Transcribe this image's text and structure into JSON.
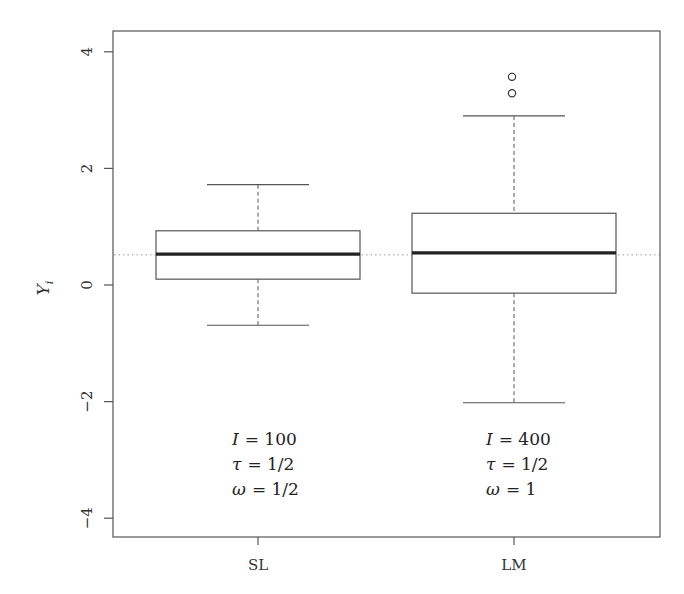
{
  "chart_data": {
    "type": "boxplot",
    "title": "",
    "xlabel": "",
    "ylabel": "Y_i",
    "ylabel_display": {
      "main": "Y",
      "sub": "i"
    },
    "ylim": [
      -4.3,
      4.6
    ],
    "yticks": [
      -4,
      -2,
      0,
      2,
      4
    ],
    "ytick_labels": [
      "−4",
      "−2",
      "0",
      "2",
      "4"
    ],
    "categories": [
      "SL",
      "LM"
    ],
    "reference_line": {
      "y": 0.5,
      "style": "dotted"
    },
    "grid": false,
    "legend": null,
    "boxes": [
      {
        "name": "SL",
        "whisker_low": -0.69,
        "q1": 0.1,
        "median": 0.53,
        "q3": 0.93,
        "whisker_high": 1.72,
        "outliers": [],
        "annotation": [
          {
            "sym": "I",
            "eq": "= 100"
          },
          {
            "sym": "τ",
            "eq": "= 1/2"
          },
          {
            "sym": "ω",
            "eq": "= 1/2"
          }
        ]
      },
      {
        "name": "LM",
        "whisker_low": -2.02,
        "q1": -0.14,
        "median": 0.55,
        "q3": 1.23,
        "whisker_high": 2.9,
        "outliers": [
          3.29,
          3.57
        ],
        "annotation": [
          {
            "sym": "I",
            "eq": "= 400"
          },
          {
            "sym": "τ",
            "eq": "= 1/2"
          },
          {
            "sym": "ω",
            "eq": "= 1"
          }
        ]
      }
    ]
  }
}
